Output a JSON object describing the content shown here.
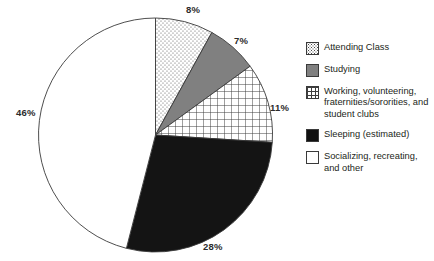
{
  "chart_data": {
    "type": "pie",
    "title": "",
    "categories": [
      "Attending Class",
      "Studying",
      "Working, volunteering, fraternities/sororities, and student clubs",
      "Sleeping (estimated)",
      "Socializing, recreating, and other"
    ],
    "values": [
      8,
      7,
      11,
      28,
      46
    ],
    "value_labels": [
      "8%",
      "7%",
      "11%",
      "28%",
      "46%"
    ],
    "unit": "%",
    "start_angle_deg": 0,
    "direction": "clockwise",
    "legend_position": "right",
    "grid": false,
    "slice_styles": [
      "dots",
      "gray",
      "grid",
      "black",
      "white"
    ],
    "colors": {
      "attending_class": "#ffffff",
      "studying": "#808080",
      "working": "#ffffff",
      "sleeping": "#111111",
      "socializing": "#ffffff",
      "outline": "#3a3a3a",
      "text": "#231f20"
    }
  },
  "slice_labels": [
    {
      "text": "8%",
      "x": 186,
      "y": 5
    },
    {
      "text": "7%",
      "x": 234,
      "y": 36
    },
    {
      "text": "11%",
      "x": 270,
      "y": 103
    },
    {
      "text": "28%",
      "x": 203,
      "y": 242
    },
    {
      "text": "46%",
      "x": 16,
      "y": 108
    }
  ],
  "legend": {
    "items": [
      {
        "label": "Attending Class",
        "swatch": "dots-swatch"
      },
      {
        "label": "Studying",
        "swatch": "gray-swatch"
      },
      {
        "label": "Working, volunteering, fraternities/sororities, and student clubs",
        "swatch": "grid-swatch"
      },
      {
        "label": "Sleeping (estimated)",
        "swatch": "black-swatch"
      },
      {
        "label": "Socializing, recreating, and other",
        "swatch": "white-swatch"
      }
    ]
  }
}
